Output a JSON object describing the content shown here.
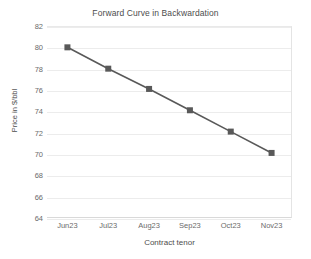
{
  "chart_data": {
    "type": "line",
    "title": "Forward Curve in Backwardation",
    "xlabel": "Contract tenor",
    "ylabel": "Price in $/bbl",
    "categories": [
      "Jun23",
      "Jul23",
      "Aug23",
      "Sep23",
      "Oct23",
      "Nov23"
    ],
    "values": [
      80.0,
      78.0,
      76.1,
      74.1,
      72.1,
      70.1
    ],
    "series": [
      {
        "name": "Forward Curve",
        "values": [
          80.0,
          78.0,
          76.1,
          74.1,
          72.1,
          70.1
        ]
      }
    ],
    "ylim": [
      64,
      82
    ],
    "ytick_step": 2,
    "yticks": [
      82,
      80,
      78,
      76,
      74,
      72,
      70,
      68,
      66,
      64
    ],
    "xlim_categories": 6,
    "grid": true,
    "grid_axis": "y",
    "legend": false,
    "legend_position": "none",
    "marker": "square",
    "line_color": "#595959",
    "marker_color": "#595959",
    "grid_color": "#ececec",
    "text_color": "#595959",
    "background_color": "#ffffff"
  }
}
